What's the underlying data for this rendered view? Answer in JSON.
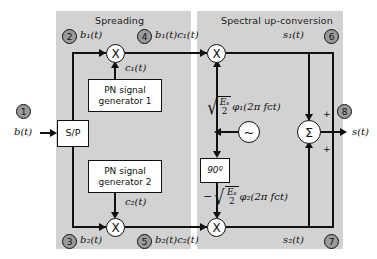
{
  "diagram": {
    "panels": [
      {
        "id": "spreading",
        "title": "Spreading"
      },
      {
        "id": "up-conversion",
        "title": "Spectral up-conversion"
      }
    ],
    "blocks": {
      "serial_to_parallel": "S/P",
      "pn_generator_1_line1": "PN signal",
      "pn_generator_1_line2": "generator 1",
      "pn_generator_2_line1": "PN signal",
      "pn_generator_2_line2": "generator 2",
      "phase_shifter": "90º",
      "multiplier_symbol": "X",
      "oscillator_symbol": "~",
      "summer_symbol": "Σ"
    },
    "nodes": [
      {
        "id": 1,
        "label": "1"
      },
      {
        "id": 2,
        "label": "2"
      },
      {
        "id": 3,
        "label": "3"
      },
      {
        "id": 4,
        "label": "4"
      },
      {
        "id": 5,
        "label": "5"
      },
      {
        "id": 6,
        "label": "6"
      },
      {
        "id": 7,
        "label": "7"
      },
      {
        "id": 8,
        "label": "8"
      }
    ],
    "signals": {
      "input": "b(t)",
      "branch_1": "b₁(t)",
      "branch_2": "b₂(t)",
      "spread_1": "b₁(t)c₁(t)",
      "spread_2": "b₂(t)c₂(t)",
      "code_1": "c₁(t)",
      "code_2": "c₂(t)",
      "modulated_1": "s₁(t)",
      "modulated_2": "s₂(t)",
      "output": "s(t)"
    },
    "carriers": {
      "upper": {
        "sign": "",
        "numerator": "Eₛ",
        "denominator": "2",
        "function": "φ₁(2π fᴄt)",
        "full": "√(Eₛ/2) φ₁(2π fᴄt)"
      },
      "lower": {
        "sign": "−",
        "numerator": "Eₛ",
        "denominator": "2",
        "function": "φ₂(2π fᴄt)",
        "full": "−√(Eₛ/2) φ₂(2π fᴄt)"
      }
    },
    "summer_signs": {
      "top": "+",
      "bottom": "+"
    },
    "colors": {
      "panel_fill": "#d2d2d2",
      "node_fill": "#9a9a9a",
      "line": "#111111",
      "block_fill": "#ffffff",
      "background": "#ffffff"
    }
  }
}
